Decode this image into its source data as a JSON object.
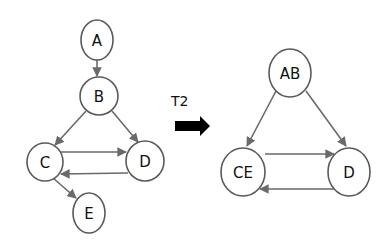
{
  "transform": {
    "label": "T2",
    "arrow_color": "#000000"
  },
  "graph_before": {
    "nodes": [
      {
        "id": "A",
        "label": "A"
      },
      {
        "id": "B",
        "label": "B"
      },
      {
        "id": "C",
        "label": "C"
      },
      {
        "id": "D",
        "label": "D"
      },
      {
        "id": "E",
        "label": "E"
      }
    ],
    "edges": [
      {
        "from": "A",
        "to": "B"
      },
      {
        "from": "B",
        "to": "C"
      },
      {
        "from": "B",
        "to": "D"
      },
      {
        "from": "C",
        "to": "D"
      },
      {
        "from": "D",
        "to": "C"
      },
      {
        "from": "C",
        "to": "E"
      }
    ]
  },
  "graph_after": {
    "nodes": [
      {
        "id": "AB",
        "label": "AB"
      },
      {
        "id": "CE",
        "label": "CE"
      },
      {
        "id": "D",
        "label": "D"
      }
    ],
    "edges": [
      {
        "from": "AB",
        "to": "CE"
      },
      {
        "from": "AB",
        "to": "D"
      },
      {
        "from": "CE",
        "to": "D"
      },
      {
        "from": "D",
        "to": "CE"
      }
    ]
  },
  "colors": {
    "node_stroke": "#5a5a5a",
    "edge_stroke": "#6a6a6a",
    "text": "#111111"
  }
}
